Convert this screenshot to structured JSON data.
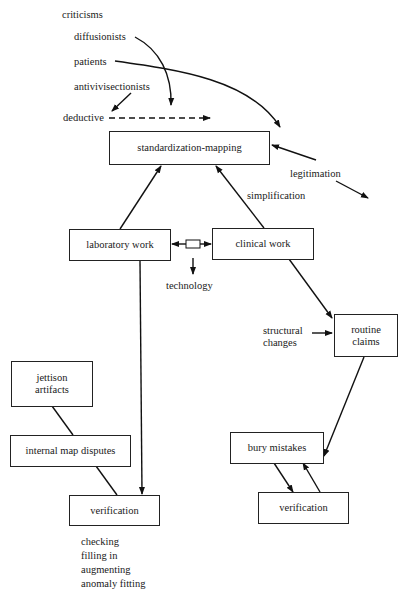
{
  "diagram": {
    "sources": {
      "criticisms": "criticisms",
      "diffusionists": "diffusionists",
      "patients": "patients",
      "antivivisectionists": "antivivisectionists",
      "deductive": "deductive"
    },
    "nodes": {
      "standardization": "standardization-mapping",
      "laboratory": "laboratory work",
      "clinical": "clinical work",
      "routine_line1": "routine",
      "routine_line2": "claims",
      "jettison_line1": "jettison",
      "jettison_line2": "artifacts",
      "internal": "internal map disputes",
      "verification_left": "verification",
      "bury": "bury mistakes",
      "verification_right": "verification"
    },
    "edge_labels": {
      "legitimation": "legitimation",
      "simplification": "simplification",
      "technology": "technology",
      "structural_line1": "structural",
      "structural_line2": "changes"
    },
    "verification_activities": [
      "checking",
      "filling in",
      "augmenting",
      "anomaly fitting"
    ]
  }
}
